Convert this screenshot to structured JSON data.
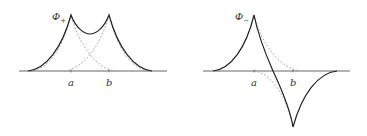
{
  "panels": [
    {
      "id": "phi-plus",
      "label": "Φ",
      "label_subscript": "+",
      "ticks": [
        {
          "name": "a",
          "label": "a"
        },
        {
          "name": "b",
          "label": "b"
        }
      ],
      "description": "Symmetric combination: two cusped peaks at a and b with solid sum curve; dashed individual exponential cusps"
    },
    {
      "id": "phi-minus",
      "label": "Φ",
      "label_subscript": "−",
      "ticks": [
        {
          "name": "a",
          "label": "a"
        },
        {
          "name": "b",
          "label": "b"
        }
      ],
      "description": "Antisymmetric combination: positive cusp at a, negative cusp at b; dashed individual exponential cusps"
    }
  ],
  "colors": {
    "solid_curve": "#222222",
    "dashed_curve": "#999999",
    "axis": "#555555",
    "text": "#333333"
  }
}
